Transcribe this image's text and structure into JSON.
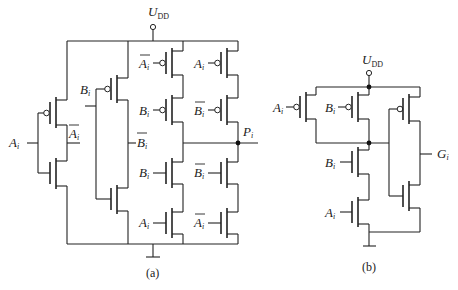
{
  "figure": {
    "circuit_a": {
      "caption": "(a)",
      "supply_label": "U",
      "supply_sub": "DD",
      "output_label": "P",
      "output_sub": "i",
      "inverter_A": {
        "input": "A",
        "input_sub": "i",
        "output": "A",
        "output_sub": "i",
        "output_bar": true
      },
      "inverter_B": {
        "input": "B",
        "input_sub": "i",
        "output": "B",
        "output_sub": "i",
        "output_bar": true
      },
      "pull_up": [
        {
          "gate": "A",
          "sub": "i",
          "bar": true
        },
        {
          "gate": "B",
          "sub": "i",
          "bar": false
        },
        {
          "gate": "A",
          "sub": "i",
          "bar": false
        },
        {
          "gate": "B",
          "sub": "i",
          "bar": true
        }
      ],
      "pull_down": [
        {
          "gate": "B",
          "sub": "i",
          "bar": false
        },
        {
          "gate": "A",
          "sub": "i",
          "bar": false
        },
        {
          "gate": "B",
          "sub": "i",
          "bar": true
        },
        {
          "gate": "A",
          "sub": "i",
          "bar": true
        }
      ]
    },
    "circuit_b": {
      "caption": "(b)",
      "supply_label": "U",
      "supply_sub": "DD",
      "output_label": "G",
      "output_sub": "i",
      "inputs": [
        {
          "gate": "A",
          "sub": "i"
        },
        {
          "gate": "B",
          "sub": "i"
        },
        {
          "gate": "B",
          "sub": "i"
        },
        {
          "gate": "A",
          "sub": "i"
        }
      ]
    }
  }
}
